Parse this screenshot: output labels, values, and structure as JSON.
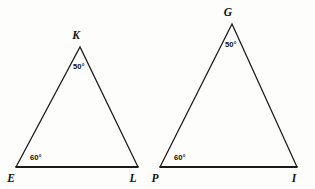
{
  "figure": {
    "type": "geometry-diagram",
    "background_color": "#fdfdfc",
    "line_color": "#1a1a1a",
    "shapes": [
      {
        "name": "triangle-kel",
        "label": "Triangle KEL",
        "vertices": [
          {
            "name": "K",
            "label": "K",
            "x": 80,
            "y": 47,
            "label_x": 76,
            "label_y": 39
          },
          {
            "name": "E",
            "label": "E",
            "x": 16,
            "y": 167,
            "label_x": 11,
            "label_y": 182
          },
          {
            "name": "L",
            "label": "L",
            "x": 138,
            "y": 167,
            "label_x": 133,
            "label_y": 182
          }
        ],
        "angles": [
          {
            "at": "K",
            "value": "50°",
            "label_x": 73,
            "label_y": 69
          },
          {
            "at": "E",
            "value": "60°",
            "label_x": 30,
            "label_y": 160
          }
        ]
      },
      {
        "name": "triangle-gpi",
        "label": "Triangle GPI",
        "vertices": [
          {
            "name": "G",
            "label": "G",
            "x": 232,
            "y": 24,
            "label_x": 228,
            "label_y": 16
          },
          {
            "name": "P",
            "label": "P",
            "x": 160,
            "y": 167,
            "label_x": 155,
            "label_y": 182
          },
          {
            "name": "I",
            "label": "I",
            "x": 297,
            "y": 167,
            "label_x": 294,
            "label_y": 182
          }
        ],
        "angles": [
          {
            "at": "G",
            "value": "50°",
            "label_x": 225,
            "label_y": 47
          },
          {
            "at": "P",
            "value": "60°",
            "label_x": 174,
            "label_y": 160
          }
        ]
      }
    ]
  }
}
